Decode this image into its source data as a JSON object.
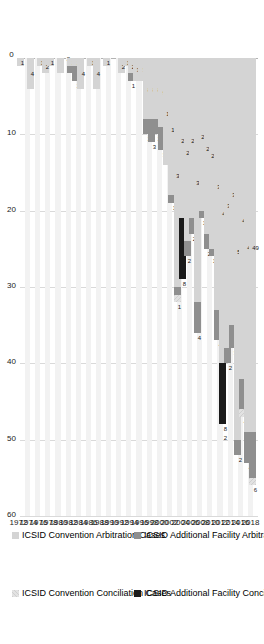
{
  "chart_data": {
    "type": "bar",
    "orientation": "horizontal",
    "stacked": true,
    "title": "",
    "xlabel": "",
    "ylabel": "",
    "xlim": [
      0,
      60
    ],
    "xticks": [
      "0",
      "10",
      "20",
      "30",
      "40",
      "50",
      "60"
    ],
    "grid": true,
    "legend_position": "right",
    "categories": [
      "1972",
      "1973",
      "1974",
      "1975",
      "1976",
      "1977",
      "1978",
      "1979",
      "1980",
      "1981",
      "1982",
      "1983",
      "1984",
      "1985",
      "1986",
      "1987",
      "1988",
      "1989",
      "1990",
      "1991",
      "1992",
      "1993",
      "1994",
      "1995",
      "1996",
      "1997",
      "1998",
      "1999",
      "2000",
      "2001",
      "2002",
      "2003",
      "2004",
      "2005",
      "2006",
      "2007",
      "2008",
      "2009",
      "2010",
      "2011",
      "2012",
      "2013",
      "2014",
      "2015",
      "2016",
      "2017",
      "2018"
    ],
    "series": [
      {
        "name": "ICSID Convention Arbitration Cases",
        "color": "#d4d4d4",
        "values": [
          1,
          0,
          4,
          0,
          1,
          2,
          1,
          0,
          2,
          0,
          1,
          1,
          4,
          0,
          1,
          4,
          0,
          1,
          0,
          0,
          2,
          1,
          2,
          3,
          3,
          8,
          8,
          8,
          9,
          14,
          18,
          30,
          21,
          24,
          21,
          32,
          20,
          23,
          25,
          33,
          40,
          38,
          35,
          50,
          42,
          49,
          49
        ]
      },
      {
        "name": "ICSID Additional Facility Arbitration Cases",
        "color": "#8f8f8f",
        "values": [
          0,
          0,
          0,
          0,
          0,
          0,
          0,
          0,
          0,
          0,
          1,
          2,
          0,
          0,
          0,
          0,
          0,
          0,
          0,
          0,
          0,
          0,
          1,
          0,
          0,
          2,
          3,
          2,
          3,
          0,
          1,
          1,
          0,
          2,
          2,
          4,
          1,
          2,
          1,
          4,
          0,
          2,
          3,
          2,
          4,
          4,
          6
        ]
      },
      {
        "name": "ICSID Convention Conciliation Cases",
        "color": "#e2e2e2",
        "values": [
          0,
          0,
          0,
          0,
          0,
          0,
          0,
          0,
          0,
          0,
          0,
          0,
          0,
          0,
          0,
          0,
          0,
          0,
          0,
          0,
          0,
          0,
          0,
          0,
          0,
          0,
          0,
          0,
          0,
          0,
          0,
          1,
          0,
          0,
          0,
          0,
          0,
          0,
          0,
          0,
          0,
          0,
          0,
          0,
          1,
          0,
          1
        ]
      },
      {
        "name": "ICSID Additional Facility Conciliation Cases",
        "color": "#1a1a1a",
        "values": [
          0,
          0,
          0,
          0,
          0,
          0,
          0,
          0,
          0,
          0,
          0,
          0,
          0,
          0,
          0,
          0,
          0,
          0,
          0,
          0,
          0,
          0,
          0,
          0,
          0,
          0,
          0,
          0,
          0,
          0,
          0,
          0,
          8,
          0,
          0,
          0,
          0,
          0,
          0,
          0,
          8,
          0,
          0,
          0,
          0,
          0,
          0
        ]
      }
    ],
    "data_labels": {
      "1972": [
        "1"
      ],
      "1974": [
        "4"
      ],
      "1976": [
        "1"
      ],
      "1977": [
        "2"
      ],
      "1978": [
        "1"
      ],
      "1981": [
        "2"
      ],
      "1982": [
        "1",
        "1"
      ],
      "1983": [
        "1",
        "2"
      ],
      "1984": [
        "4"
      ],
      "1986": [
        "1"
      ],
      "1987": [
        "4"
      ],
      "1989": [
        "1"
      ],
      "1992": [
        "2"
      ],
      "1993": [
        "1"
      ],
      "1994": [
        "2",
        "1"
      ],
      "1995": [
        "3"
      ],
      "1996": [
        "3"
      ],
      "1997": [
        "8",
        "2"
      ],
      "1998": [
        "8",
        "3"
      ],
      "1999": [
        "8",
        "2"
      ],
      "2000": [
        "9",
        "3"
      ],
      "2001": [
        "14"
      ],
      "2002": [
        "18",
        "1"
      ],
      "2003": [
        "30",
        "1"
      ],
      "2004": [
        "21",
        "8"
      ],
      "2005": [
        "24",
        "2"
      ],
      "2006": [
        "21",
        "2"
      ],
      "2007": [
        "32",
        "4"
      ],
      "2008": [
        "20",
        "1"
      ],
      "2009": [
        "23",
        "2"
      ],
      "2010": [
        "25",
        "1"
      ],
      "2011": [
        "33",
        "4"
      ],
      "2012": [
        "40",
        "8",
        "2"
      ],
      "2013": [
        "38",
        "2"
      ],
      "2014": [
        "35",
        "3"
      ],
      "2015": [
        "50",
        "2"
      ],
      "2016": [
        "42",
        "4"
      ],
      "2017": [
        "49",
        "4"
      ],
      "2018": [
        "49",
        "6"
      ]
    }
  },
  "legend": {
    "items": [
      {
        "label": "ICSID Convention Arbitration Cases",
        "swatch": "sw-conv-arb"
      },
      {
        "label": "ICSID Additional Facility Arbitration Cases",
        "swatch": "sw-af-arb"
      },
      {
        "label": "ICSID Convention Conciliation Cases",
        "swatch": "sw-conv-con"
      },
      {
        "label": "ICSID Additional Facility Conciliation Cases",
        "swatch": "sw-af-con"
      }
    ]
  }
}
